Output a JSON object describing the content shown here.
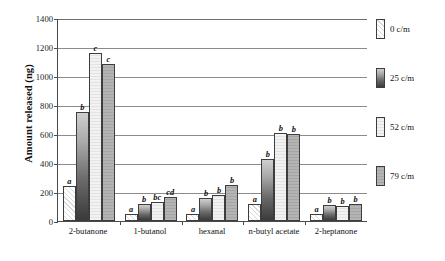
{
  "chart_data": {
    "type": "bar",
    "title": "",
    "xlabel": "",
    "ylabel": "Amount released (ng)",
    "ylim": [
      0,
      1400
    ],
    "ytick_labels": [
      "0",
      "200",
      "400",
      "600",
      "800",
      "1000",
      "1200",
      "1400"
    ],
    "ytick_values": [
      0,
      200,
      400,
      600,
      800,
      1000,
      1200,
      1400
    ],
    "grid": "horizontal",
    "legend_position": "right",
    "categories": [
      "2-butanone",
      "1-butanol",
      "hexanal",
      "n-butyl acetate",
      "2-heptanone"
    ],
    "series": [
      {
        "name": "0 c/m",
        "values": [
          240,
          50,
          50,
          120,
          50
        ],
        "annotations": [
          "a",
          "a",
          "a",
          "a",
          "a"
        ]
      },
      {
        "name": "25 c/m",
        "values": [
          755,
          115,
          160,
          430,
          110
        ],
        "annotations": [
          "b",
          "b",
          "b",
          "b",
          "b"
        ]
      },
      {
        "name": "52 c/m",
        "values": [
          1160,
          130,
          180,
          605,
          105
        ],
        "annotations": [
          "c",
          "bc",
          "b",
          "b",
          "b"
        ]
      },
      {
        "name": "79 c/m",
        "values": [
          1085,
          165,
          250,
          600,
          120
        ],
        "annotations": [
          "c",
          "cd",
          "b",
          "b",
          "b"
        ]
      }
    ]
  },
  "legend": {
    "items": [
      {
        "label": "0 c/m"
      },
      {
        "label": "25 c/m"
      },
      {
        "label": "52 c/m"
      },
      {
        "label": "79 c/m"
      }
    ]
  }
}
